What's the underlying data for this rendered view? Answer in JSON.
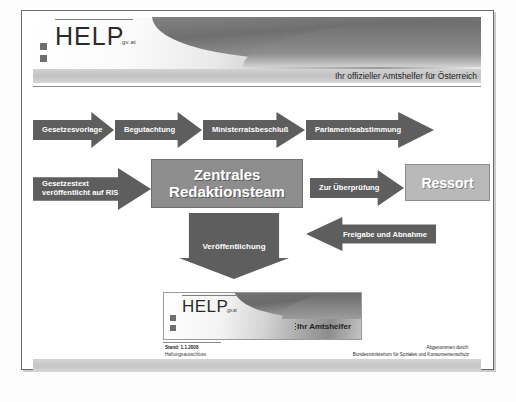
{
  "slide": {
    "header": {
      "logo_text": "HELP",
      "logo_suffix": ".gv.at",
      "tagline": "Ihr offizieller Amtshelfer für Österreich"
    },
    "flow": {
      "row1": [
        {
          "id": "gesetzesvorlage",
          "label": "Gesetzesvorlage",
          "shape": "arrow-right"
        },
        {
          "id": "begutachtung",
          "label": "Begutachtung",
          "shape": "arrow-right"
        },
        {
          "id": "ministerratsbeschluss",
          "label": "Ministerratsbeschluß",
          "shape": "arrow-right"
        },
        {
          "id": "parlamentsabstimmung",
          "label": "Parlamentsabstimmung",
          "shape": "arrow-right"
        }
      ],
      "row2": [
        {
          "id": "gesetzestext-ris",
          "label": "Gesetzestext veröffentlicht auf RIS",
          "line1": "Gesetzestext",
          "line2": "veröffentlicht auf RIS",
          "shape": "arrow-right"
        },
        {
          "id": "zentrales-redaktionsteam",
          "line1": "Zentrales",
          "line2": "Redaktionsteam",
          "shape": "box"
        },
        {
          "id": "zur-ueberpruefung",
          "label": "Zur Überprüfung",
          "shape": "arrow-right"
        },
        {
          "id": "ressort",
          "label": "Ressort",
          "shape": "box"
        }
      ],
      "row3": [
        {
          "id": "veroeffentlichung",
          "label": "Veröffentlichung",
          "shape": "arrow-down"
        },
        {
          "id": "freigabe-abnahme",
          "label": "Freigabe und Abnahme",
          "shape": "arrow-left"
        }
      ]
    },
    "result_banner": {
      "logo_text": "HELP",
      "logo_suffix": ".gv.at",
      "slogan": "Ihr Amtshelfer"
    },
    "footer": {
      "left_line1": "Stand: 1.1.2008",
      "left_line2": "Haftungsausschluss",
      "right_line1": "Abgenommen durch:",
      "right_line2": "Bundesministerium für Soziales und Konsumentenschutz"
    }
  },
  "colors": {
    "arrow_fill": "#5e5e5e",
    "box_dark": "#8d8d8d",
    "box_light": "#b9b9b9",
    "frame": "#6b6b6b"
  }
}
